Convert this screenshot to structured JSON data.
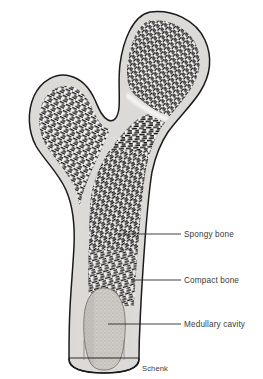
{
  "figure": {
    "signature": "Schenk",
    "background_color": "#ffffff",
    "outline_color": "#1a1a1a",
    "cortical_color": "#dcdcdc",
    "trabecular_color": "#1c1c1c",
    "marrow_color": "#c9c6c2",
    "label_color": "#3a3a3a"
  },
  "labels": [
    {
      "id": "spongy-bone",
      "text": "Spongy bone",
      "text_x": 184,
      "text_y": 237,
      "leader_x1": 118,
      "leader_x2": 181,
      "leader_y": 234
    },
    {
      "id": "compact-bone",
      "text": "Compact bone",
      "text_x": 184,
      "text_y": 283,
      "leader_x1": 131,
      "leader_x2": 181,
      "leader_y": 280
    },
    {
      "id": "medullary-cavity",
      "text": "Medullary cavity",
      "text_x": 184,
      "text_y": 327,
      "leader_x1": 108,
      "leader_x2": 181,
      "leader_y": 324
    }
  ],
  "anatomy": {
    "femoral_head": "superior rounded epiphysis with dense radiating trabeculae",
    "greater_trochanter": "lateral prominence on the left with fan-shaped trabeculae",
    "epiphyseal_line": "pale curved band across the head",
    "shaft": "diaphysis tapering inferiorly with thick compact cortical walls",
    "medullary_cavity": "stippled marrow space within the shaft",
    "cut_edge": "rounded cut-away at the inferior end of the shaft"
  }
}
